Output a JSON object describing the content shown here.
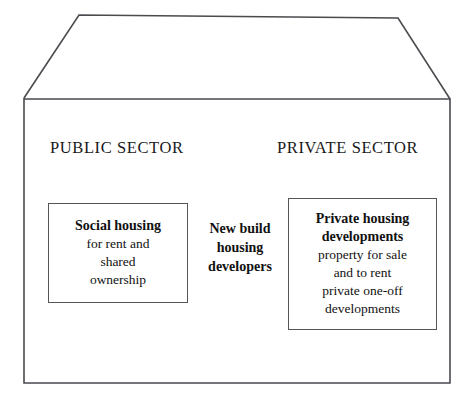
{
  "diagram": {
    "stroke_color": "#55555a",
    "text_color": "#111111",
    "background_color": "#ffffff",
    "shape": "house-outline"
  },
  "sectors": {
    "public": "PUBLIC SECTOR",
    "private": "PRIVATE SECTOR"
  },
  "blocks": {
    "social_housing": {
      "heading": "Social housing",
      "lines": [
        "for rent and",
        "shared",
        "ownership"
      ],
      "boxed": true
    },
    "new_build": {
      "lines": [
        "New build",
        "housing",
        "developers"
      ],
      "boxed": false
    },
    "private_housing": {
      "heading_lines": [
        "Private housing",
        "developments"
      ],
      "lines": [
        "property for sale",
        "and to rent",
        "private one-off",
        "developments"
      ],
      "boxed": true
    }
  }
}
